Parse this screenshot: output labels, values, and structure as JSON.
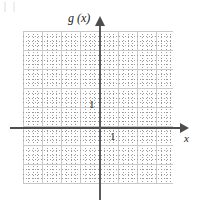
{
  "figure": {
    "kind": "blank-coordinate-grid",
    "background_color": "#ffffff"
  },
  "axes": {
    "y_axis_label": "g (x)",
    "x_axis_label": "x",
    "axis_color": "#4d4d4d",
    "origin": {
      "x": 100,
      "y": 128
    },
    "unit_tick_labels": {
      "y_unit": "1",
      "x_unit": "1"
    }
  },
  "grid": {
    "major_line_color": "#c9c9c9",
    "minor_line_color": "#9a9a9a",
    "major_spacing_px": 19,
    "minor_spacing_px": 4.75,
    "columns_major": 8,
    "rows_major": 8,
    "left_px": 23,
    "top_px": 31,
    "width_px": 150,
    "height_px": 152
  },
  "chart_data": {
    "type": "line",
    "title": "",
    "xlabel": "x",
    "ylabel": "g (x)",
    "xlim": [
      -4,
      4
    ],
    "ylim": [
      -3,
      5
    ],
    "xticks": [
      -4,
      -3,
      -2,
      -1,
      0,
      1,
      2,
      3,
      4
    ],
    "yticks": [
      -3,
      -2,
      -1,
      0,
      1,
      2,
      3,
      4,
      5
    ],
    "tick_labels_shown": [
      "1",
      "1"
    ],
    "grid": true,
    "legend": false,
    "series": [],
    "annotations": [
      {
        "text": "g (x)",
        "position": "top-of-y-axis"
      },
      {
        "text": "x",
        "position": "right-of-x-axis"
      },
      {
        "text": "1",
        "position": "y-axis-unit-left-of-axis"
      },
      {
        "text": "1",
        "position": "x-axis-unit-below-axis"
      }
    ]
  }
}
